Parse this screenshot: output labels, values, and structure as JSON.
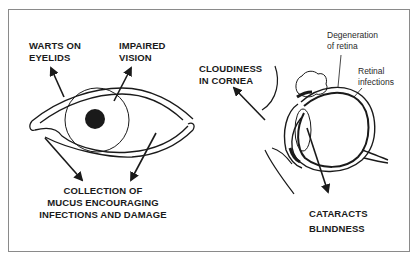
{
  "diagram": {
    "left_figure": {
      "name": "external eye",
      "labels": {
        "warts": "WARTS ON\nEYELIDS",
        "impaired_vision": "IMPAIRED\nVISION",
        "mucus": "COLLECTION OF\nMUCUS ENCOURAGING\nINFECTIONS AND DAMAGE"
      }
    },
    "right_figure": {
      "name": "eye cross-section",
      "labels": {
        "cloudiness": "CLOUDINESS\nIN CORNEA",
        "degeneration": "Degeneration\nof retina",
        "retinal_infections": "Retinal\ninfections",
        "cataracts": "CATARACTS\nBLINDNESS"
      }
    },
    "colors": {
      "ink": "#1a1a1a",
      "frame": "#8a8a8a",
      "background": "#ffffff"
    }
  }
}
